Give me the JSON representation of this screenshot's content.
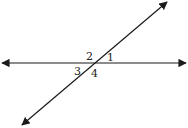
{
  "diagram": {
    "type": "intersecting-lines",
    "colors": {
      "line": "#1a1a1a",
      "label": "#222222",
      "background": "#ffffff"
    },
    "lines": [
      {
        "name": "horizontal-line",
        "from": [
          2,
          63
        ],
        "to": [
          186,
          63
        ],
        "arrows": "both"
      },
      {
        "name": "transversal-line",
        "from": [
          22,
          125
        ],
        "to": [
          167,
          2
        ],
        "arrows": "both"
      }
    ],
    "intersection": [
      94,
      63
    ],
    "angles": [
      {
        "label": "1",
        "x": 107,
        "y": 61
      },
      {
        "label": "2",
        "x": 86,
        "y": 60
      },
      {
        "label": "3",
        "x": 74,
        "y": 75
      },
      {
        "label": "4",
        "x": 91,
        "y": 77
      }
    ]
  }
}
